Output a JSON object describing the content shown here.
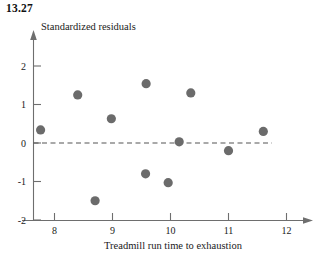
{
  "figure": {
    "exercise_number": "13.27"
  },
  "chart_data": {
    "type": "scatter",
    "title": "",
    "xlabel": "Treadmill run time to exhaustion",
    "ylabel": "Standardized residuals",
    "xlim": [
      7.3,
      12.4
    ],
    "ylim": [
      -2.2,
      2.4
    ],
    "xticks": [
      8,
      9,
      10,
      11,
      12
    ],
    "xtick_labels": [
      "8",
      "9",
      "10",
      "11",
      "12"
    ],
    "yticks": [
      2,
      1,
      0,
      -1,
      -2
    ],
    "ytick_labels": [
      "2",
      "1",
      "0",
      "-1",
      "-2"
    ],
    "grid": false,
    "legend": null,
    "reference_line": {
      "orientation": "horizontal",
      "value": 0,
      "style": "dashed",
      "color": "#555555"
    },
    "marker": {
      "shape": "circle",
      "color": "#6b6b6b",
      "size": 4.6
    },
    "axis_color": "#6e6e6e",
    "points": [
      {
        "x": 7.76,
        "y": 0.34
      },
      {
        "x": 8.4,
        "y": 1.25
      },
      {
        "x": 8.7,
        "y": -1.5
      },
      {
        "x": 8.98,
        "y": 0.63
      },
      {
        "x": 9.57,
        "y": -0.8
      },
      {
        "x": 9.58,
        "y": 1.54
      },
      {
        "x": 9.96,
        "y": -1.03
      },
      {
        "x": 10.15,
        "y": 0.03
      },
      {
        "x": 10.35,
        "y": 1.3
      },
      {
        "x": 11.0,
        "y": -0.2
      },
      {
        "x": 11.6,
        "y": 0.3
      }
    ]
  }
}
